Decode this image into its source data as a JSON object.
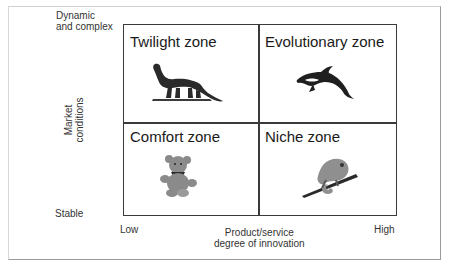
{
  "y_axis": {
    "title_line1": "Market",
    "title_line2": "conditions",
    "top_label_line1": "Dynamic",
    "top_label_line2": "and complex",
    "bottom_label": "Stable"
  },
  "x_axis": {
    "title_line1": "Product/service",
    "title_line2": "degree of innovation",
    "left_label": "Low",
    "right_label": "High"
  },
  "quadrants": [
    {
      "position": "top-left",
      "title": "Twilight zone",
      "icon": "dinosaur-icon"
    },
    {
      "position": "top-right",
      "title": "Evolutionary zone",
      "icon": "dolphin-icon"
    },
    {
      "position": "bottom-left",
      "title": "Comfort zone",
      "icon": "teddy-bear-icon"
    },
    {
      "position": "bottom-right",
      "title": "Niche zone",
      "icon": "chameleon-icon"
    }
  ],
  "colors": {
    "border": "#3a3a3a",
    "text": "#222222",
    "icon_dark": "#2a2a2a",
    "icon_gray": "#8a8a8a"
  }
}
